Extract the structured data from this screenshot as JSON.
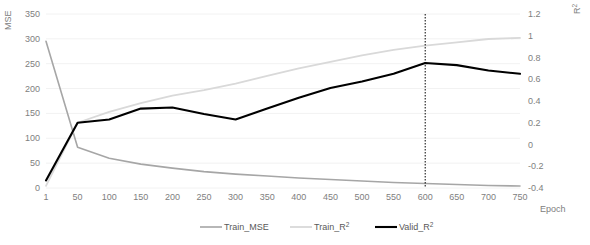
{
  "chart_data": {
    "type": "line",
    "title": "",
    "xlabel": "Epoch",
    "y_left_label": "MSE",
    "y_right_label": "R²",
    "x": [
      1,
      50,
      100,
      150,
      200,
      250,
      300,
      350,
      400,
      450,
      500,
      550,
      600,
      650,
      700,
      750
    ],
    "xtick_labels": [
      "1",
      "50",
      "100",
      "150",
      "200",
      "250",
      "300",
      "350",
      "400",
      "450",
      "500",
      "550",
      "600",
      "650",
      "700",
      "750"
    ],
    "ylim_left": [
      0,
      350
    ],
    "ytick_left": [
      0,
      50,
      100,
      150,
      200,
      250,
      300,
      350
    ],
    "ytick_left_labels": [
      "0",
      "50",
      "100",
      "150",
      "200",
      "250",
      "300",
      "350"
    ],
    "ylim_right": [
      -0.4,
      1.2
    ],
    "ytick_right": [
      -0.4,
      -0.2,
      0,
      0.2,
      0.4,
      0.6,
      0.8,
      1.0,
      1.2
    ],
    "ytick_right_labels": [
      "-0.4",
      "-0.2",
      "0",
      "0.2",
      "0.4",
      "0.6",
      "0.8",
      "1",
      "1.2"
    ],
    "grid": true,
    "legend_position": "bottom",
    "series": [
      {
        "name": "Train_MSE",
        "axis": "left",
        "color": "#a6a6a6",
        "width": 1.6,
        "values": [
          295,
          82,
          60,
          48,
          40,
          33,
          28,
          24,
          20,
          17,
          14,
          11,
          9,
          7,
          5,
          4
        ]
      },
      {
        "name": "Train_R²",
        "axis": "right",
        "color": "#d9d9d9",
        "width": 1.8,
        "values": [
          -0.38,
          0.2,
          0.3,
          0.38,
          0.45,
          0.5,
          0.56,
          0.63,
          0.7,
          0.76,
          0.82,
          0.87,
          0.91,
          0.94,
          0.97,
          0.98
        ]
      },
      {
        "name": "Valid_R²",
        "axis": "right",
        "color": "#000000",
        "width": 2.1,
        "values": [
          -0.33,
          0.2,
          0.23,
          0.33,
          0.34,
          0.28,
          0.23,
          0.33,
          0.43,
          0.52,
          0.58,
          0.65,
          0.75,
          0.73,
          0.68,
          0.65
        ]
      }
    ],
    "annotations": [
      {
        "type": "vline",
        "name": "best-epoch-marker",
        "x": 600,
        "style": "dotted",
        "color": "#000000"
      }
    ]
  },
  "legend": {
    "items": [
      {
        "label": "Train_MSE",
        "color": "#a6a6a6",
        "width": 1.6
      },
      {
        "label": "Train_R",
        "sup": "2",
        "color": "#d9d9d9",
        "width": 1.8
      },
      {
        "label": "Valid_R",
        "sup": "2",
        "color": "#000000",
        "width": 2.1
      }
    ]
  },
  "axes": {
    "left_title": "MSE",
    "right_title_base": "R",
    "right_title_sup": "2",
    "x_title": "Epoch"
  },
  "colors": {
    "grid": "#f2f2f2",
    "tick_text": "#808080",
    "legend_text": "#595959",
    "axis_line": "#e6e6e6"
  }
}
